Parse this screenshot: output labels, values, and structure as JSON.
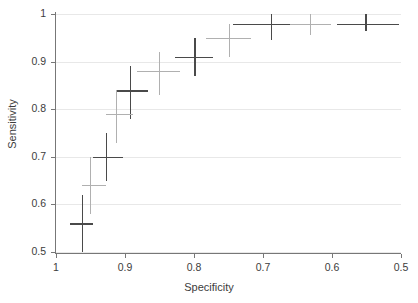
{
  "chart_data": {
    "type": "scatter",
    "title": "",
    "xlabel": "Specificity",
    "ylabel": "Sensitivity",
    "xlim": [
      1.0,
      0.5
    ],
    "ylim": [
      0.5,
      1.0
    ],
    "x_reversed": true,
    "grid": true,
    "legend": "none",
    "xticks": [
      "1",
      "0.9",
      "0.8",
      "0.7",
      "0.6",
      "0.5"
    ],
    "xtick_values": [
      1.0,
      0.9,
      0.8,
      0.7,
      0.6,
      0.5
    ],
    "yticks": [
      "0.5",
      "0.6",
      "0.7",
      "0.8",
      "0.9",
      "1"
    ],
    "ytick_values": [
      0.5,
      0.6,
      0.7,
      0.8,
      0.9,
      1.0
    ],
    "colors": {
      "series_dark": "#4a4a4a",
      "series_light": "#b0b0b0",
      "axis": "#777777",
      "grid": "#e8e8e8",
      "text": "#3c3c3c",
      "background": "#ffffff"
    },
    "series": [
      {
        "name": "series-dark",
        "color": "#4a4a4a",
        "marker": "cross-with-error-bars",
        "points": [
          {
            "x": 0.963,
            "y": 0.56,
            "xerr_lo": 0.979,
            "xerr_hi": 0.947,
            "yerr_lo": 0.5,
            "yerr_hi": 0.62
          },
          {
            "x": 0.928,
            "y": 0.7,
            "xerr_lo": 0.947,
            "xerr_hi": 0.903,
            "yerr_lo": 0.65,
            "yerr_hi": 0.75
          },
          {
            "x": 0.893,
            "y": 0.84,
            "xerr_lo": 0.913,
            "xerr_hi": 0.866,
            "yerr_lo": 0.78,
            "yerr_hi": 0.89
          },
          {
            "x": 0.8,
            "y": 0.91,
            "xerr_lo": 0.827,
            "xerr_hi": 0.773,
            "yerr_lo": 0.87,
            "yerr_hi": 0.95
          },
          {
            "x": 0.689,
            "y": 0.98,
            "xerr_lo": 0.744,
            "xerr_hi": 0.648,
            "yerr_lo": 0.945,
            "yerr_hi": 1.0
          },
          {
            "x": 0.552,
            "y": 0.98,
            "xerr_lo": 0.593,
            "xerr_hi": 0.503,
            "yerr_lo": 0.965,
            "yerr_hi": 1.0
          }
        ]
      },
      {
        "name": "series-light",
        "color": "#b0b0b0",
        "marker": "cross-with-error-bars",
        "points": [
          {
            "x": 0.951,
            "y": 0.64,
            "xerr_lo": 0.963,
            "xerr_hi": 0.928,
            "yerr_lo": 0.58,
            "yerr_hi": 0.7
          },
          {
            "x": 0.913,
            "y": 0.79,
            "xerr_lo": 0.928,
            "xerr_hi": 0.889,
            "yerr_lo": 0.73,
            "yerr_hi": 0.84
          },
          {
            "x": 0.851,
            "y": 0.88,
            "xerr_lo": 0.882,
            "xerr_hi": 0.82,
            "yerr_lo": 0.83,
            "yerr_hi": 0.92
          },
          {
            "x": 0.75,
            "y": 0.95,
            "xerr_lo": 0.783,
            "xerr_hi": 0.717,
            "yerr_lo": 0.91,
            "yerr_hi": 0.98
          },
          {
            "x": 0.632,
            "y": 0.98,
            "xerr_lo": 0.661,
            "xerr_hi": 0.602,
            "yerr_lo": 0.955,
            "yerr_hi": 1.0
          }
        ]
      }
    ]
  }
}
